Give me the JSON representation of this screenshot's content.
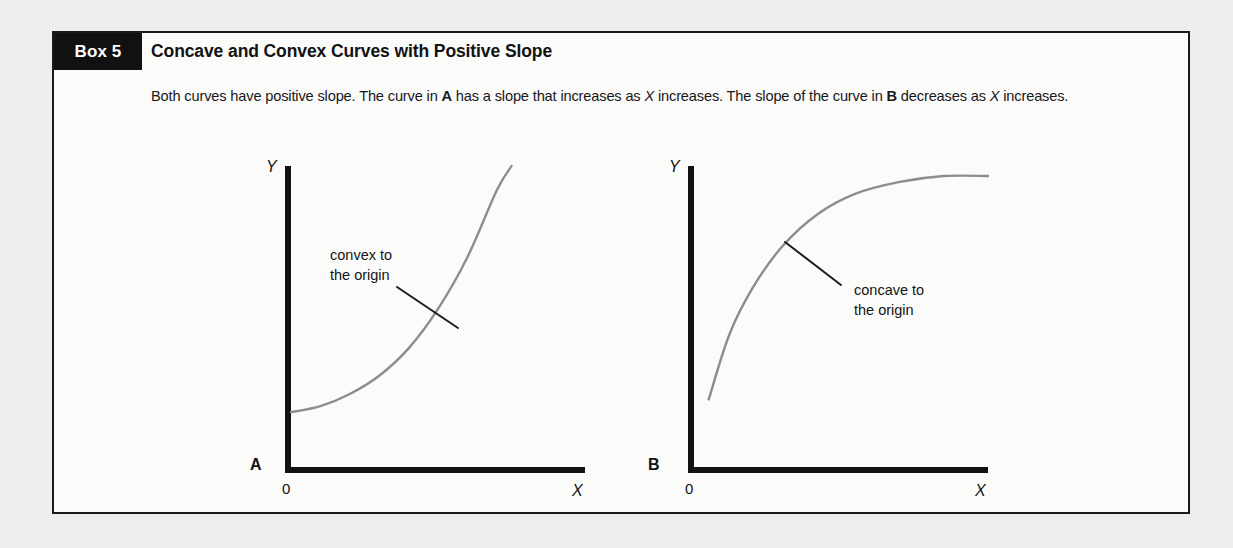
{
  "box": {
    "tab_label": "Box 5",
    "title": "Concave and Convex Curves with Positive Slope",
    "intro": {
      "part1": "Both curves have positive slope. The curve in ",
      "bold_a": "A",
      "part2": " has a slope that increases as ",
      "italic_x1": "X",
      "part3": " increases. The slope of the curve in ",
      "bold_b": "B",
      "part4": " decreases as ",
      "italic_x2": "X",
      "part5": " increases."
    }
  },
  "chart_data": [
    {
      "type": "line",
      "panel": "A",
      "panel_label": "A",
      "title": "",
      "xlabel": "X",
      "ylabel": "Y",
      "origin_label": "0",
      "annotation": {
        "line1": "convex to",
        "line2": "the origin"
      },
      "description": "Convex to the origin: positive slope that increases as X increases",
      "grid": false,
      "legend": "none",
      "xlim": [
        0,
        100
      ],
      "ylim": [
        0,
        100
      ],
      "x": [
        0,
        10,
        20,
        30,
        40,
        50,
        60,
        70,
        75
      ],
      "y": [
        19,
        21,
        25,
        31,
        40,
        53,
        70,
        92,
        100
      ],
      "curve_color": "#8d8d8d",
      "axis_color": "#121212"
    },
    {
      "type": "line",
      "panel": "B",
      "panel_label": "B",
      "title": "",
      "xlabel": "X",
      "ylabel": "Y",
      "origin_label": "0",
      "annotation": {
        "line1": "concave to",
        "line2": "the origin"
      },
      "description": "Concave to the origin: positive slope that decreases as X increases",
      "grid": false,
      "legend": "none",
      "xlim": [
        0,
        100
      ],
      "ylim": [
        0,
        100
      ],
      "x": [
        5,
        12,
        20,
        30,
        42,
        55,
        70,
        85,
        100
      ],
      "y": [
        24,
        46,
        62,
        76,
        87,
        94,
        98,
        100,
        100
      ],
      "curve_color": "#8d8d8d",
      "axis_color": "#121212"
    }
  ],
  "colors": {
    "page_background": "#eeedeb",
    "box_background": "#fbfbfa",
    "box_border": "#1a1a1a",
    "tab_background": "#111111",
    "tab_text": "#ffffff",
    "text": "#17171a",
    "curve": "#8d8d8d",
    "axis": "#121212"
  }
}
